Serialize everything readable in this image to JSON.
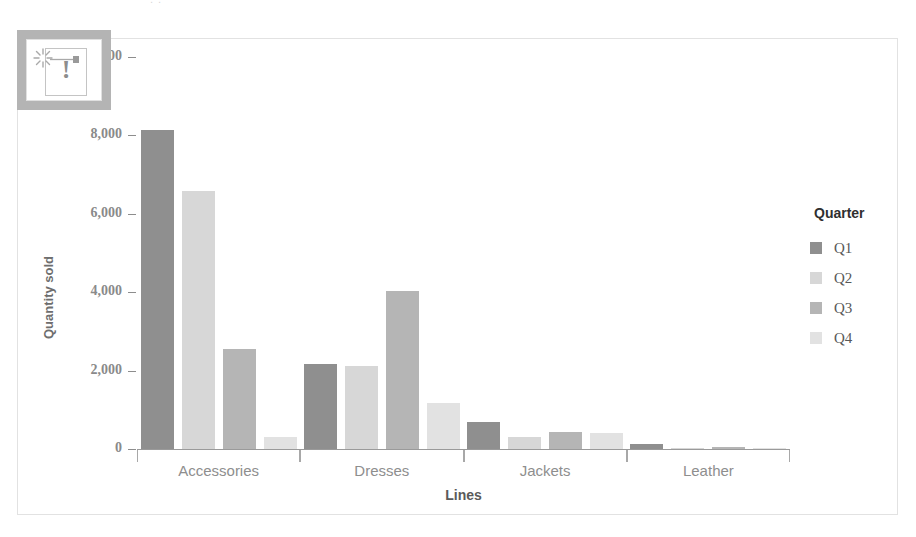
{
  "page": {
    "clipped_top_text": ". ."
  },
  "overlay": {
    "icon": "broken-image-icon",
    "glyph": "!"
  },
  "legend": {
    "title": "Quarter",
    "items": [
      {
        "label": "Q1",
        "color": "#8f8f8f"
      },
      {
        "label": "Q2",
        "color": "#d7d7d7"
      },
      {
        "label": "Q3",
        "color": "#b5b5b5"
      },
      {
        "label": "Q4",
        "color": "#e2e2e2"
      }
    ]
  },
  "chart_data": {
    "type": "bar",
    "title": "",
    "subtitle": "",
    "xlabel": "Lines",
    "ylabel": "Quantity sold",
    "categories": [
      "Accessories",
      "Dresses",
      "Jackets",
      "Leather"
    ],
    "series": [
      {
        "name": "Q1",
        "color": "#8f8f8f",
        "values": [
          8150,
          2180,
          700,
          140
        ]
      },
      {
        "name": "Q2",
        "color": "#d7d7d7",
        "values": [
          6580,
          2120,
          300,
          20
        ]
      },
      {
        "name": "Q3",
        "color": "#b5b5b5",
        "values": [
          2560,
          4020,
          440,
          60
        ]
      },
      {
        "name": "Q4",
        "color": "#e2e2e2",
        "values": [
          300,
          1180,
          400,
          15
        ]
      }
    ],
    "ylim": [
      0,
      10000
    ],
    "yticks": [
      0,
      2000,
      4000,
      6000,
      8000,
      10000
    ],
    "ytick_labels": [
      "0",
      "2,000",
      "4,000",
      "6,000",
      "8,000",
      "10,000"
    ],
    "grid": false,
    "legend_position": "right",
    "legend_title": "Quarter"
  }
}
